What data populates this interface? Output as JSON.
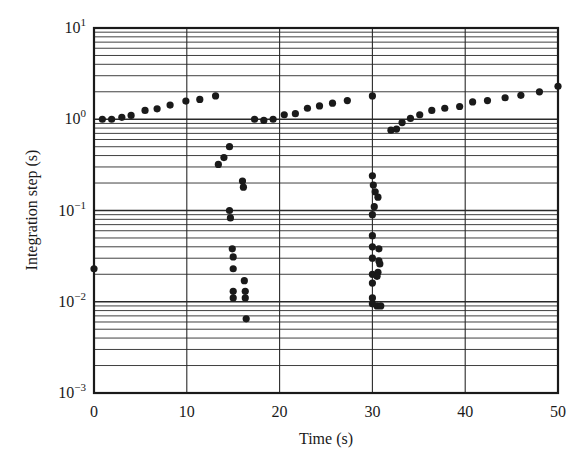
{
  "chart_data": {
    "type": "scatter",
    "title": "",
    "xlabel": "Time (s)",
    "ylabel": "Integration step (s)",
    "xlim": [
      0,
      50
    ],
    "ylim": [
      0.001,
      10
    ],
    "yscale": "log",
    "grid": true,
    "x_ticks": [
      "0",
      "10",
      "20",
      "30",
      "40",
      "50"
    ],
    "y_ticks": [
      {
        "base": "10",
        "exp": "1"
      },
      {
        "base": "10",
        "exp": "0"
      },
      {
        "base": "10",
        "exp": "−1"
      },
      {
        "base": "10",
        "exp": "−2"
      },
      {
        "base": "10",
        "exp": "−3"
      }
    ],
    "series": [
      {
        "name": "integration step",
        "marker": "filled-circle",
        "color": "#1a1a1a",
        "points": [
          [
            0.0,
            0.023
          ],
          [
            0.9,
            1.0
          ],
          [
            1.9,
            1.0
          ],
          [
            3.0,
            1.05
          ],
          [
            4.0,
            1.1
          ],
          [
            5.5,
            1.25
          ],
          [
            6.8,
            1.3
          ],
          [
            8.2,
            1.43
          ],
          [
            9.9,
            1.58
          ],
          [
            11.4,
            1.65
          ],
          [
            13.1,
            1.8
          ],
          [
            13.4,
            0.32
          ],
          [
            14.0,
            0.38
          ],
          [
            14.6,
            0.5
          ],
          [
            14.6,
            0.1
          ],
          [
            14.7,
            0.083
          ],
          [
            14.9,
            0.038
          ],
          [
            15.0,
            0.031
          ],
          [
            15.0,
            0.023
          ],
          [
            15.0,
            0.013
          ],
          [
            15.0,
            0.011
          ],
          [
            16.0,
            0.21
          ],
          [
            16.1,
            0.18
          ],
          [
            16.2,
            0.017
          ],
          [
            16.3,
            0.013
          ],
          [
            16.3,
            0.011
          ],
          [
            16.4,
            0.0065
          ],
          [
            17.3,
            1.0
          ],
          [
            18.3,
            0.97
          ],
          [
            19.3,
            1.0
          ],
          [
            20.5,
            1.12
          ],
          [
            21.7,
            1.15
          ],
          [
            23.0,
            1.32
          ],
          [
            24.3,
            1.4
          ],
          [
            25.7,
            1.5
          ],
          [
            27.3,
            1.6
          ],
          [
            30.0,
            1.8
          ],
          [
            30.0,
            0.24
          ],
          [
            30.1,
            0.19
          ],
          [
            30.3,
            0.16
          ],
          [
            30.6,
            0.14
          ],
          [
            30.2,
            0.11
          ],
          [
            30.0,
            0.09
          ],
          [
            30.0,
            0.053
          ],
          [
            30.0,
            0.04
          ],
          [
            30.0,
            0.03
          ],
          [
            30.0,
            0.02
          ],
          [
            30.0,
            0.016
          ],
          [
            30.7,
            0.038
          ],
          [
            30.7,
            0.028
          ],
          [
            30.8,
            0.026
          ],
          [
            30.6,
            0.021
          ],
          [
            30.5,
            0.019
          ],
          [
            30.0,
            0.011
          ],
          [
            30.0,
            0.0095
          ],
          [
            30.5,
            0.009
          ],
          [
            30.9,
            0.009
          ],
          [
            32.0,
            0.76
          ],
          [
            32.6,
            0.78
          ],
          [
            33.2,
            0.92
          ],
          [
            34.1,
            1.02
          ],
          [
            35.1,
            1.12
          ],
          [
            36.4,
            1.25
          ],
          [
            37.8,
            1.32
          ],
          [
            39.4,
            1.38
          ],
          [
            40.8,
            1.55
          ],
          [
            42.4,
            1.6
          ],
          [
            44.3,
            1.72
          ],
          [
            46.0,
            1.83
          ],
          [
            48.0,
            2.0
          ],
          [
            50.0,
            2.3
          ]
        ]
      }
    ]
  },
  "layout": {
    "frame": {
      "left": 94,
      "top": 28,
      "right": 558,
      "bottom": 393
    }
  }
}
